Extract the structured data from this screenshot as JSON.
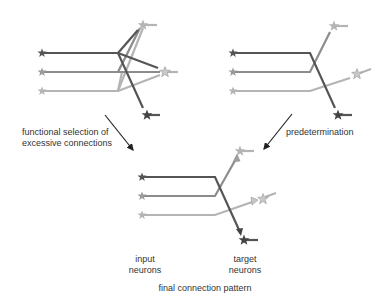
{
  "colors": {
    "dark": "#555555",
    "mid": "#8c8c8c",
    "light": "#b4b4b4",
    "arrow": "#222222",
    "text": "#333333"
  },
  "labels": {
    "functional_selection_line1": "functional selection of",
    "functional_selection_line2": "excessive connections",
    "predetermination": "predetermination",
    "input_neurons_line1": "input",
    "input_neurons_line2": "neurons",
    "target_neurons_line1": "target",
    "target_neurons_line2": "neurons",
    "final_pattern": "final connection pattern"
  },
  "panels": [
    {
      "name": "excessive-connections-panel",
      "inputs": 3,
      "targets": 3
    },
    {
      "name": "predetermined-panel",
      "inputs": 3,
      "targets": 3
    },
    {
      "name": "final-connection-panel",
      "inputs": 3,
      "targets": 3
    }
  ]
}
